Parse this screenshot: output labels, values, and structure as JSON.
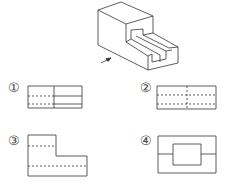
{
  "figure": {
    "arrow": "view-direction-arrow",
    "line_color": "#333333"
  },
  "options": [
    {
      "label": "①",
      "shape": "rectangle with vertical divider; dashed lines left, solid lines right"
    },
    {
      "label": "②",
      "shape": "rectangle with all dashed interior lines"
    },
    {
      "label": "③",
      "shape": "L-shaped outline with dashed lines"
    },
    {
      "label": "④",
      "shape": "rectangle with inner rectangle and side lines"
    }
  ]
}
